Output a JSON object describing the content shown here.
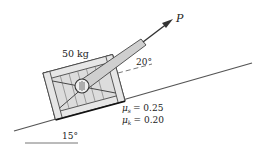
{
  "diagram": {
    "mass_label": "50 kg",
    "force_label": "P",
    "force_angle_label": "20°",
    "incline_angle_label": "15°",
    "friction": {
      "static": {
        "symbol": "μ",
        "sub": "s",
        "value": "= 0.25"
      },
      "kinetic": {
        "symbol": "μ",
        "sub": "k",
        "value": "= 0.20"
      }
    },
    "colors": {
      "line": "#333333",
      "crate_fill": "#d9d9d9",
      "crate_stroke": "#444444",
      "background": "#ffffff"
    }
  }
}
